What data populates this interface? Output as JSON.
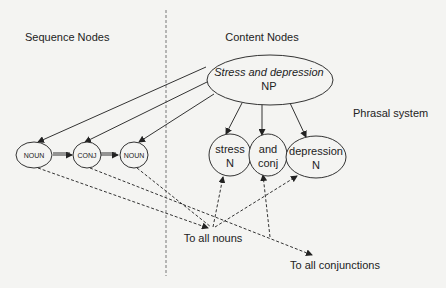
{
  "diagram": {
    "section_labels": {
      "sequence": "Sequence Nodes",
      "content": "Content Nodes",
      "phrasal": "Phrasal system"
    },
    "phrase_node": {
      "line1": "Stress and depression",
      "line2": "NP"
    },
    "sequence_nodes": [
      {
        "label": "NOUN"
      },
      {
        "label": "CONJ"
      },
      {
        "label": "NOUN"
      }
    ],
    "sequence_link_label": "=",
    "content_nodes": [
      {
        "word": "stress",
        "category": "N"
      },
      {
        "word": "and",
        "category": "conj"
      },
      {
        "word": "depression",
        "category": "N"
      }
    ],
    "targets": {
      "nouns": "To all nouns",
      "conjunctions": "To all conjunctions"
    },
    "colors": {
      "background": "#f4f4f2",
      "stroke": "#333333",
      "text": "#222222"
    }
  }
}
